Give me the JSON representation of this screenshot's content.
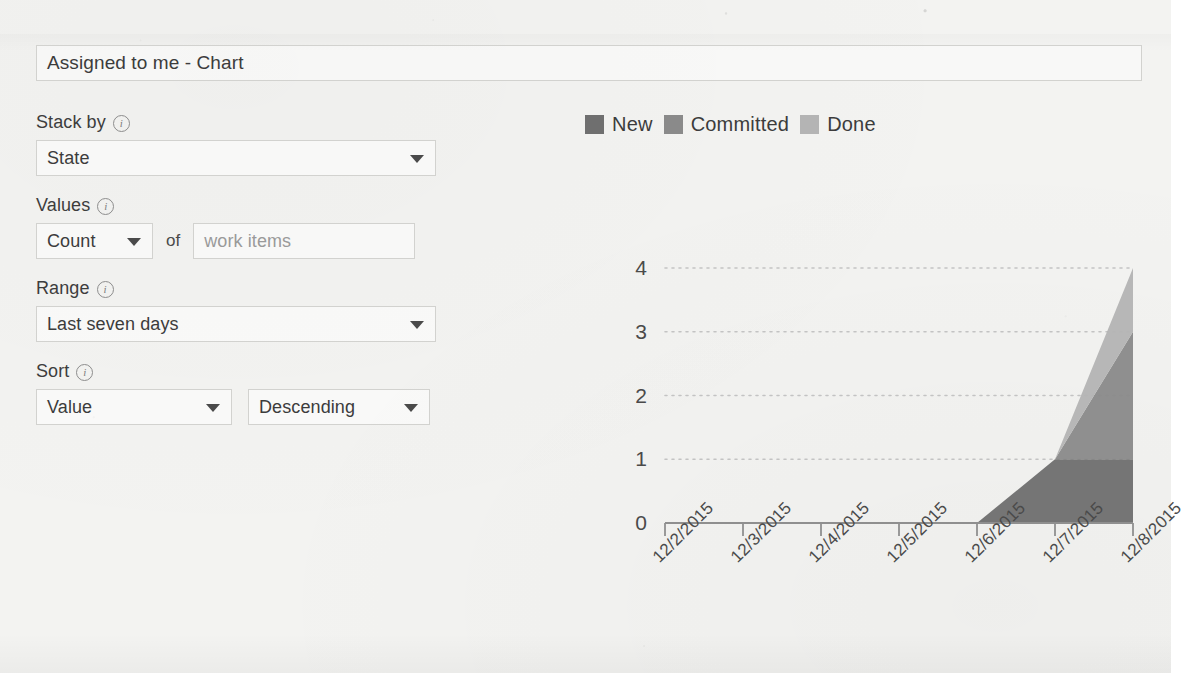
{
  "title_field": {
    "value": "Assigned to me - Chart",
    "name": "chart-title-input"
  },
  "config": {
    "stack_by": {
      "label": "Stack by",
      "info_icon": "info-circle-icon",
      "value": "State"
    },
    "values": {
      "label": "Values",
      "info_icon": "info-circle-icon",
      "aggregation": "Count",
      "of_text": "of",
      "field_value": "work items"
    },
    "range": {
      "label": "Range",
      "info_icon": "info-circle-icon",
      "value": "Last seven days"
    },
    "sort": {
      "label": "Sort",
      "info_icon": "info-circle-icon",
      "by_value": "Value",
      "direction_value": "Descending"
    },
    "caret_icon": "chevron-down-icon"
  },
  "chart_data": {
    "type": "area",
    "stacked": true,
    "title": "",
    "xlabel": "",
    "ylabel": "",
    "categories": [
      "12/2/2015",
      "12/3/2015",
      "12/4/2015",
      "12/5/2015",
      "12/6/2015",
      "12/7/2015",
      "12/8/2015"
    ],
    "series": [
      {
        "name": "New",
        "color": "#6f6f6f",
        "values": [
          0,
          0,
          0,
          0,
          0,
          1,
          1
        ]
      },
      {
        "name": "Committed",
        "color": "#8a8a8a",
        "values": [
          0,
          0,
          0,
          0,
          0,
          0,
          2
        ]
      },
      {
        "name": "Done",
        "color": "#b4b4b4",
        "values": [
          0,
          0,
          0,
          0,
          0,
          0,
          1
        ]
      }
    ],
    "stack_totals": [
      0,
      0,
      0,
      0,
      0,
      1,
      4
    ],
    "yticks": [
      0,
      1,
      2,
      3,
      4
    ],
    "ylim": [
      0,
      4
    ],
    "grid": "horizontal-dotted",
    "legend_position": "top-left",
    "axis_label_rotation": -45,
    "last_label_clipped": true
  },
  "colors": {
    "new": "#6f6f6f",
    "committed": "#8a8a8a",
    "done": "#b4b4b4",
    "axis": "#9a9a9a",
    "grid": "#c3c3c3",
    "text": "#3c3c3c",
    "border": "#d2d2cf",
    "paper": "#f3f3f1"
  }
}
